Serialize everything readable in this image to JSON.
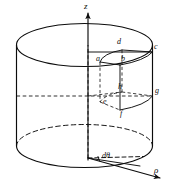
{
  "figure": {
    "type": "geometry-diagram",
    "colors": {
      "stroke": "#0c0c0c",
      "background": "#ffffff",
      "label": "#0c0c0c"
    },
    "axes": [
      {
        "id": "z-axis",
        "label": "z",
        "direction": "up",
        "style": "solid-arrow"
      },
      {
        "id": "rho-axis",
        "label": "ρ",
        "direction": "down-right",
        "style": "solid-arrow"
      }
    ],
    "angle": {
      "id": "d-theta",
      "label": "dθ",
      "description": "differential angle at base between two radii"
    },
    "element_vertices": [
      {
        "id": "vertex-a",
        "label": "a",
        "position": "top-inner-front"
      },
      {
        "id": "vertex-b",
        "label": "b",
        "position": "top-outer-front"
      },
      {
        "id": "vertex-c",
        "label": "c",
        "position": "top-outer-right"
      },
      {
        "id": "vertex-d",
        "label": "d",
        "position": "top-inner-back"
      },
      {
        "id": "vertex-e",
        "label": "e",
        "position": "bottom-inner-front"
      },
      {
        "id": "vertex-f",
        "label": "f",
        "position": "bottom-outer-front"
      },
      {
        "id": "vertex-g",
        "label": "g",
        "position": "bottom-outer-right"
      },
      {
        "id": "vertex-h",
        "label": "h",
        "position": "bottom-inner-back"
      }
    ],
    "shapes": [
      {
        "id": "cylinder-body",
        "kind": "cylinder",
        "style": "solid"
      },
      {
        "id": "cylinder-top-ellipse",
        "kind": "ellipse",
        "style": "solid"
      },
      {
        "id": "cylinder-bottom-ellipse-front",
        "kind": "arc",
        "style": "solid"
      },
      {
        "id": "cylinder-bottom-ellipse-back",
        "kind": "arc",
        "style": "dashed"
      },
      {
        "id": "mid-hidden-ellipse",
        "kind": "arc",
        "style": "dashed"
      },
      {
        "id": "volume-element",
        "kind": "wedge-box",
        "style": "mixed"
      }
    ]
  }
}
